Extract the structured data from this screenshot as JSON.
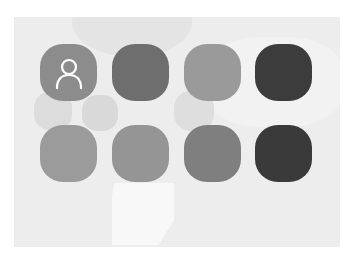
{
  "panel": {
    "background": "#ededed"
  },
  "icons": [
    {
      "name": "account",
      "glyph": "person-icon",
      "color": "#8c8c8c",
      "row": 0,
      "col": 0
    },
    {
      "name": "app-2",
      "glyph": "",
      "color": "#6e6e6e",
      "row": 0,
      "col": 1
    },
    {
      "name": "app-3",
      "glyph": "",
      "color": "#9a9a9a",
      "row": 0,
      "col": 2
    },
    {
      "name": "app-4",
      "glyph": "",
      "color": "#3c3c3c",
      "row": 0,
      "col": 3
    },
    {
      "name": "app-5",
      "glyph": "",
      "color": "#9b9b9b",
      "row": 1,
      "col": 0
    },
    {
      "name": "app-6",
      "glyph": "",
      "color": "#959595",
      "row": 1,
      "col": 1
    },
    {
      "name": "app-7",
      "glyph": "",
      "color": "#7f7f7f",
      "row": 1,
      "col": 2
    },
    {
      "name": "app-8",
      "glyph": "",
      "color": "#3a3a3a",
      "row": 1,
      "col": 3
    }
  ]
}
